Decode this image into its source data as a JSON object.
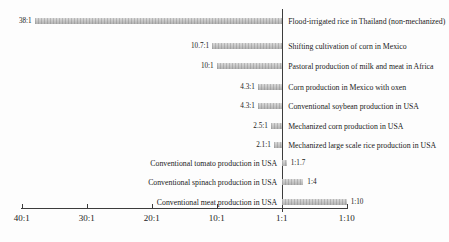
{
  "chart_data": {
    "type": "bar",
    "orientation": "horizontal",
    "axis": {
      "ticks": [
        {
          "label": "40:1",
          "out": 40,
          "in": 1
        },
        {
          "label": "30:1",
          "out": 30,
          "in": 1
        },
        {
          "label": "20:1",
          "out": 20,
          "in": 1
        },
        {
          "label": "10:1",
          "out": 10,
          "in": 1
        },
        {
          "label": "1:1",
          "out": 1,
          "in": 1
        },
        {
          "label": "1:10",
          "out": 1,
          "in": 10
        }
      ]
    },
    "rows": [
      {
        "label": "Flood-irrigated rice in Thailand (non-mechanized)",
        "ratio": "38:1",
        "out": 38,
        "in": 1
      },
      {
        "label": "Shifting cultivation of corn in Mexico",
        "ratio": "10.7:1",
        "out": 10.7,
        "in": 1
      },
      {
        "label": "Pastoral production of milk and meat in Africa",
        "ratio": "10:1",
        "out": 10,
        "in": 1
      },
      {
        "label": "Corn production in Mexico with oxen",
        "ratio": "4.3:1",
        "out": 4.3,
        "in": 1
      },
      {
        "label": "Conventional soybean production in USA",
        "ratio": "4.3:1",
        "out": 4.3,
        "in": 1
      },
      {
        "label": "Mechanized corn production in USA",
        "ratio": "2.5:1",
        "out": 2.5,
        "in": 1
      },
      {
        "label": "Mechanized large scale rice production in USA",
        "ratio": "2.1:1",
        "out": 2.1,
        "in": 1
      },
      {
        "label": "Conventional tomato production in USA",
        "ratio": "1:1.7",
        "out": 1,
        "in": 1.7
      },
      {
        "label": "Conventional spinach production in USA",
        "ratio": "1:4",
        "out": 1,
        "in": 4
      },
      {
        "label": "Conventional meat production in USA",
        "ratio": "1:10",
        "out": 1,
        "in": 10
      }
    ],
    "colors": {
      "bar": "#c7c7c7",
      "axis": "#3c3c3c",
      "text": "#1a1a1a",
      "background": "#fdfdfd"
    },
    "legend": null,
    "grid": false
  }
}
